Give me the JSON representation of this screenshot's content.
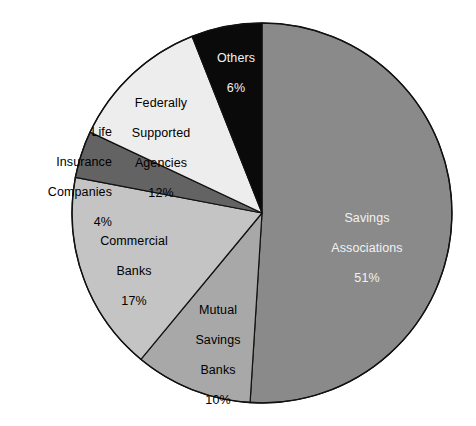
{
  "chart_data": {
    "type": "pie",
    "title": "",
    "subtitle": "",
    "xlabel": "",
    "ylabel": "",
    "legend_position": "none",
    "grid": false,
    "labels_inside": true,
    "units": "percent",
    "categories": [
      "Savings Associations",
      "Others",
      "Federally Supported Agencies",
      "Life Insurance Companies",
      "Commercial Banks",
      "Mutual Savings Banks"
    ],
    "values": [
      51,
      6,
      12,
      4,
      17,
      10
    ],
    "slices": [
      {
        "name": "Savings Associations",
        "value": 51,
        "value_label": "51%",
        "name_lines": "Savings\nAssociations",
        "color": "#8a8a8a",
        "text_color": "#f2f2f2",
        "start_angle_deg": 0,
        "end_angle_deg": 183.6,
        "label_placement": "inside"
      },
      {
        "name": "Mutual Savings Banks",
        "value": 10,
        "value_label": "10%",
        "name_lines": "Mutual\nSavings\nBanks",
        "color": "#a8a8a8",
        "text_color": "#000000",
        "start_angle_deg": 183.6,
        "end_angle_deg": 219.6,
        "label_placement": "inside"
      },
      {
        "name": "Commercial Banks",
        "value": 17,
        "value_label": "17%",
        "name_lines": "Commercial\nBanks",
        "color": "#c4c4c4",
        "text_color": "#000000",
        "start_angle_deg": 219.6,
        "end_angle_deg": 280.8,
        "label_placement": "inside"
      },
      {
        "name": "Life Insurance Companies",
        "value": 4,
        "value_label": "4%",
        "name_lines": "Life\nInsurance\nCompanies",
        "color": "#636363",
        "text_color": "#000000",
        "start_angle_deg": 280.8,
        "end_angle_deg": 295.2,
        "label_placement": "outside-left"
      },
      {
        "name": "Federally Supported Agencies",
        "value": 12,
        "value_label": "12%",
        "name_lines": "Federally\nSupported\nAgencies",
        "color": "#ededed",
        "text_color": "#000000",
        "start_angle_deg": 295.2,
        "end_angle_deg": 338.4,
        "label_placement": "inside"
      },
      {
        "name": "Others",
        "value": 6,
        "value_label": "6%",
        "name_lines": "Others",
        "color": "#0a0a0a",
        "text_color": "#f2f2f2",
        "start_angle_deg": 338.4,
        "end_angle_deg": 360,
        "label_placement": "inside"
      }
    ],
    "total": 100,
    "colors": {
      "savings_associations": "#8a8a8a",
      "mutual_savings_banks": "#a8a8a8",
      "commercial_banks": "#c4c4c4",
      "life_insurance_companies": "#636363",
      "federally_supported_agencies": "#ededed",
      "others": "#0a0a0a",
      "outline": "#111111",
      "background": "#ffffff"
    }
  },
  "labels": {
    "savings_associations": {
      "line1": "Savings",
      "line2": "Associations",
      "value": "51%"
    },
    "mutual_savings_banks": {
      "line1": "Mutual",
      "line2": "Savings",
      "line3": "Banks",
      "value": "10%"
    },
    "commercial_banks": {
      "line1": "Commercial",
      "line2": "Banks",
      "value": "17%"
    },
    "life_insurance_companies": {
      "line1": "Life",
      "line2": "Insurance",
      "line3": "Companies",
      "value": "4%"
    },
    "federally_supported_agencies": {
      "line1": "Federally",
      "line2": "Supported",
      "line3": "Agencies",
      "value": "12%"
    },
    "others": {
      "line1": "Others",
      "value": "6%"
    }
  }
}
